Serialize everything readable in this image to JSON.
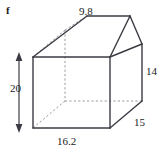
{
  "figure": {
    "part_label": "f",
    "shape_name": "pentagonal-prism",
    "stroke_color": "#3b3b44",
    "dashed_color": "#9a9aa2",
    "background": "#ffffff",
    "dimensions": {
      "top_slant": "9.8",
      "right_height": "14",
      "depth": "15",
      "total_height": "20",
      "base_width": "16.2"
    },
    "labels": {
      "top": "9.8",
      "right": "14",
      "depth": "15",
      "height": "20",
      "bottom": "16.2"
    }
  }
}
